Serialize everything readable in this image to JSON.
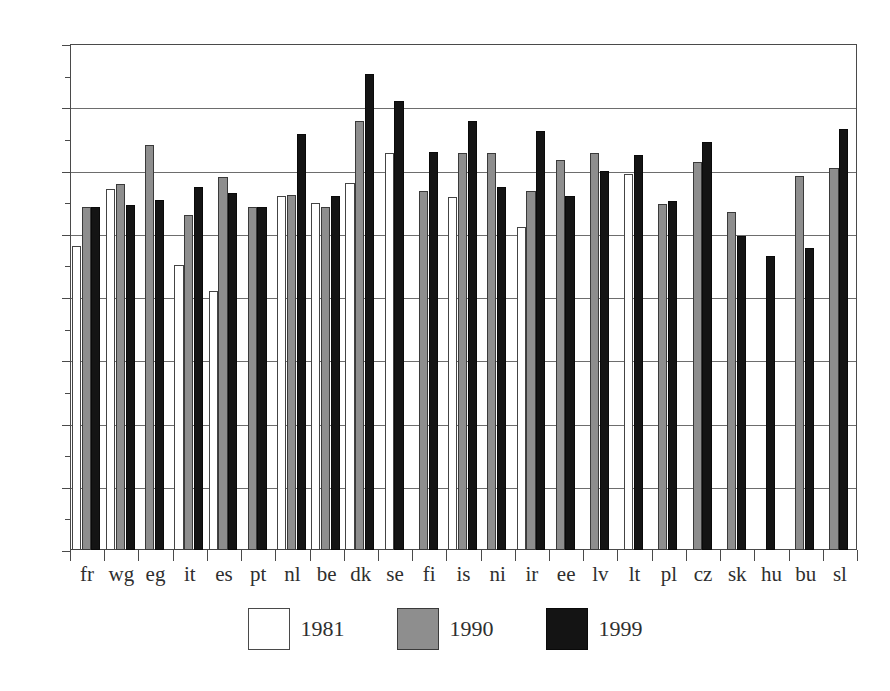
{
  "chart_data": {
    "type": "bar",
    "title": "",
    "subtitle": "",
    "xlabel": "",
    "ylabel": "",
    "ylim": [
      0,
      80
    ],
    "ytick_step": 10,
    "yminor_step": 5,
    "grid": true,
    "grid_axis": "y",
    "legend_position": "bottom-center",
    "ytick_labels": [
      "0",
      "10",
      "20",
      "30",
      "40",
      "50",
      "60",
      "70",
      "80"
    ],
    "ytick_values": [
      0,
      10,
      20,
      30,
      40,
      50,
      60,
      70,
      80
    ],
    "categories": [
      "fr",
      "wg",
      "eg",
      "it",
      "es",
      "pt",
      "nl",
      "be",
      "dk",
      "se",
      "fi",
      "is",
      "ni",
      "ir",
      "ee",
      "lv",
      "lt",
      "pl",
      "cz",
      "sk",
      "hu",
      "bu",
      "sl"
    ],
    "series": [
      {
        "name": "1981",
        "color": "#ffffff",
        "edge_color": "#444444",
        "values": [
          48.0,
          57.0,
          null,
          45.0,
          41.0,
          null,
          56.0,
          54.8,
          58.0,
          62.8,
          null,
          55.8,
          null,
          51.0,
          null,
          null,
          59.5,
          null,
          null,
          null,
          null,
          null,
          null
        ]
      },
      {
        "name": "1990",
        "color": "#8e8e8e",
        "edge_color": "#3a3a3a",
        "values": [
          54.2,
          57.8,
          64.0,
          53.0,
          59.0,
          54.2,
          56.1,
          54.3,
          67.8,
          null,
          56.8,
          62.8,
          62.8,
          56.8,
          61.7,
          62.7,
          null,
          54.7,
          61.3,
          53.5,
          null,
          59.2,
          60.4
        ]
      },
      {
        "name": "1999",
        "color": "#141414",
        "edge_color": "#0a0a0a",
        "values": [
          54.2,
          54.5,
          55.3,
          57.4,
          56.5,
          54.2,
          65.8,
          56.0,
          75.2,
          71.0,
          63.0,
          67.8,
          57.4,
          66.2,
          56.0,
          60.0,
          62.5,
          55.2,
          64.5,
          49.7,
          46.5,
          47.8,
          66.5
        ]
      }
    ]
  },
  "legend": {
    "entries": [
      {
        "label": "1981",
        "swatch": "white-swatch"
      },
      {
        "label": "1990",
        "swatch": "gray-swatch"
      },
      {
        "label": "1999",
        "swatch": "black-swatch"
      }
    ]
  },
  "colors": {
    "series_1981": "#ffffff",
    "series_1990": "#8e8e8e",
    "series_1999": "#141414",
    "axis": "#4a4a4a",
    "grid": "#6d6d6d",
    "background": "#ffffff"
  }
}
